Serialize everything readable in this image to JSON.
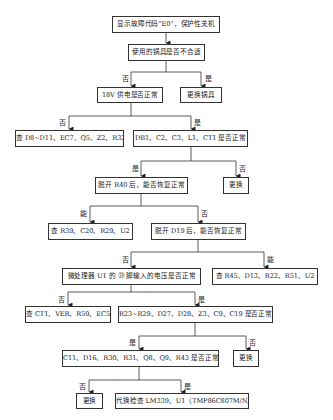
{
  "diagram": {
    "type": "flowchart",
    "nodes": {
      "n1": "显示故障代码“E0”，保护性关机",
      "n2": "使用的锅具是否不合适",
      "n3": "18V 供电是否正常",
      "n4": "更换锅具",
      "n5": "查 D8~D11、EC7、Q5、Z2、R32",
      "n6": "DB1、C2、C3、L1、CT1 是否正常",
      "n7": "脱开 R40 后，能否恢复正常",
      "n8": "更换",
      "n9": "查 R39、C20、R29、U2",
      "n10": "脱开 D19 后，能否恢复正常",
      "n11": "微处理器 U1 的 ㉓ 脚输入的电压是否正常",
      "n12": "查 R45、D13、R22、R51、U2",
      "n13": "查 CT1、VER、R59、EC5",
      "n14": "R23~R29、D27、D28、Z3、C9、C19 是否正常",
      "n15": "C11、D16、R30、R31、Q8、Q9、R43 是否正常",
      "n16": "更换",
      "n17": "更换",
      "n18": "代换检查 LM339、U1（TMP86C807M/N）"
    },
    "edge_labels": {
      "n2_n3": "否",
      "n2_n4": "是",
      "n3_n5": "否",
      "n3_n6": "是",
      "n6_n7": "是",
      "n6_n8": "否",
      "n7_n9": "能",
      "n7_n10": "否",
      "n10_n11": "否",
      "n10_n12": "能",
      "n11_n13": "否",
      "n11_n14": "是",
      "n14_n15": "是",
      "n14_n16": "否",
      "n15_n17": "否",
      "n15_n18": "是"
    },
    "edges": [
      [
        "n1",
        "n2"
      ],
      [
        "n2",
        "n3"
      ],
      [
        "n2",
        "n4"
      ],
      [
        "n3",
        "n5"
      ],
      [
        "n3",
        "n6"
      ],
      [
        "n6",
        "n7"
      ],
      [
        "n6",
        "n8"
      ],
      [
        "n7",
        "n9"
      ],
      [
        "n7",
        "n10"
      ],
      [
        "n10",
        "n11"
      ],
      [
        "n10",
        "n12"
      ],
      [
        "n11",
        "n13"
      ],
      [
        "n11",
        "n14"
      ],
      [
        "n14",
        "n15"
      ],
      [
        "n14",
        "n16"
      ],
      [
        "n15",
        "n17"
      ],
      [
        "n15",
        "n18"
      ]
    ]
  }
}
